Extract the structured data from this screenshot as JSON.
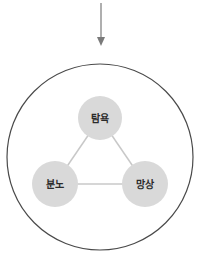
{
  "diagram": {
    "arrow": {
      "direction": "down",
      "color": "#7a7a7a"
    },
    "outer_circle": {
      "stroke": "#4a4a4a"
    },
    "nodes": [
      {
        "id": "top",
        "label": "탐욕",
        "fill": "#d9d9d9"
      },
      {
        "id": "left",
        "label": "분노",
        "fill": "#d9d9d9"
      },
      {
        "id": "right",
        "label": "망상",
        "fill": "#d9d9d9"
      }
    ],
    "edges": [
      {
        "from": "top",
        "to": "left"
      },
      {
        "from": "top",
        "to": "right"
      },
      {
        "from": "left",
        "to": "right"
      }
    ],
    "edge_color": "#c8c8c8"
  }
}
